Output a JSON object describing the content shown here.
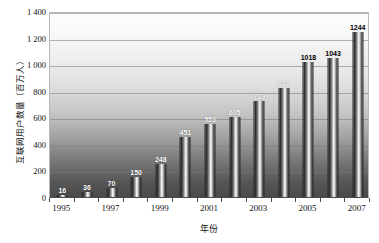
{
  "chart_data": {
    "type": "bar",
    "title": "",
    "xlabel": "年份",
    "ylabel": "互联网用户数量（百万人）",
    "categories": [
      "1995",
      "1996",
      "1997",
      "1998",
      "1999",
      "2000",
      "2001",
      "2002",
      "2003",
      "2004",
      "2005",
      "2006",
      "2007"
    ],
    "values": [
      16,
      36,
      70,
      150,
      248,
      451,
      553,
      605,
      719,
      817,
      1018,
      1043,
      1244
    ],
    "value_labels": [
      "16",
      "36",
      "70",
      "150",
      "248",
      "451",
      "553",
      "605",
      "719",
      "817",
      "1018",
      "1043",
      "1244"
    ],
    "ylim": [
      0,
      1400
    ],
    "yticks": [
      0,
      200,
      400,
      600,
      800,
      1000,
      1200,
      1400
    ],
    "ytick_labels": [
      "0",
      "200",
      "400",
      "600",
      "800",
      "1 000",
      "1 200",
      "1 400"
    ],
    "xtick_labels": [
      "1995",
      "1997",
      "1999",
      "2001",
      "2003",
      "2005",
      "2007"
    ],
    "xtick_categories": [
      "1995",
      "1997",
      "1999",
      "2001",
      "2003",
      "2005",
      "2007"
    ],
    "grid": true,
    "legend": "none",
    "colors": {
      "bar_light": "#f2f2f2",
      "bar_dark": "#2e2e2e",
      "plot_top": "#fdfdfd",
      "plot_bottom": "#4a4a4a",
      "gridline": "#787878",
      "text": "#111111"
    }
  }
}
